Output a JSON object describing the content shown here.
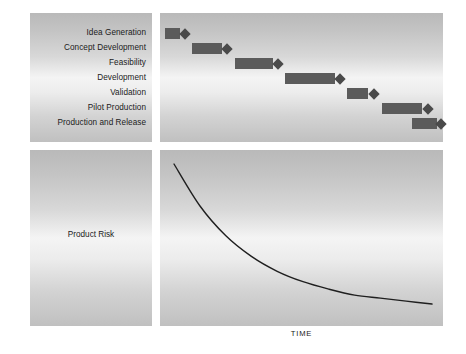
{
  "figure": {
    "axis_label": "TIME",
    "risk_label": "Product Risk",
    "bar_color": "#5b5b5b",
    "milestone_color": "#4a4a4a",
    "panel_background": "#d8d8d8"
  },
  "phases": [
    {
      "label": "Idea Generation"
    },
    {
      "label": "Concept Development"
    },
    {
      "label": "Feasibility"
    },
    {
      "label": "Development"
    },
    {
      "label": "Validation"
    },
    {
      "label": "Pilot Production"
    },
    {
      "label": "Production and Release"
    }
  ],
  "chart_data": {
    "type": "bar",
    "title": "",
    "xlabel": "TIME",
    "ylabel": "",
    "categories": [
      "Idea Generation",
      "Concept Development",
      "Feasibility",
      "Development",
      "Validation",
      "Pilot Production",
      "Production and Release"
    ],
    "orientation": "horizontal",
    "grid": false,
    "legend": "none",
    "xlim": [
      0,
      283
    ],
    "bars": [
      {
        "category": "Idea Generation",
        "start": 5,
        "end": 20,
        "milestone": 25
      },
      {
        "category": "Concept Development",
        "start": 32,
        "end": 62,
        "milestone": 67
      },
      {
        "category": "Feasibility",
        "start": 75,
        "end": 113,
        "milestone": 118
      },
      {
        "category": "Development",
        "start": 125,
        "end": 175,
        "milestone": 180
      },
      {
        "category": "Validation",
        "start": 187,
        "end": 208,
        "milestone": 214
      },
      {
        "category": "Pilot Production",
        "start": 222,
        "end": 262,
        "milestone": 268
      },
      {
        "category": "Production and Release",
        "start": 252,
        "end": 277,
        "milestone": 281
      }
    ],
    "risk_curve": {
      "type": "line",
      "name": "Product Risk",
      "description": "Exponential decay of product risk over time",
      "x": [
        0,
        10,
        20,
        30,
        40,
        50,
        60,
        70,
        80,
        90,
        100
      ],
      "y": [
        100,
        72,
        52,
        38,
        28,
        21,
        16,
        12,
        10,
        8,
        6
      ],
      "ylabel": "Product Risk",
      "xlabel": "TIME"
    }
  }
}
